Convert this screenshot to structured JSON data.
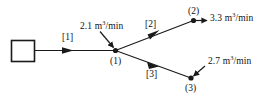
{
  "diagram": {
    "background_color": "#ffffff",
    "line_color": "#1a1a1a",
    "source": {
      "shape": "rectangle",
      "label": ""
    },
    "pipes": [
      {
        "id": "pipe-1",
        "label": "[1]",
        "from": "source",
        "to": "(1)"
      },
      {
        "id": "pipe-2",
        "label": "[2]",
        "from": "(1)",
        "to": "(2)"
      },
      {
        "id": "pipe-3",
        "label": "[3]",
        "from": "(1)",
        "to": "(3)"
      }
    ],
    "nodes": [
      {
        "id": "node-1",
        "label": "(1)"
      },
      {
        "id": "node-2",
        "label": "(2)"
      },
      {
        "id": "node-3",
        "label": "(3)"
      }
    ],
    "flows": [
      {
        "id": "flow-inflow-node1",
        "value": "2.1",
        "unit_prefix": "m",
        "unit_exp": "3",
        "unit_suffix": "/min",
        "at_node": "(1)",
        "direction": "in"
      },
      {
        "id": "flow-outflow-node2",
        "value": "3.3",
        "unit_prefix": "m",
        "unit_exp": "3",
        "unit_suffix": "/min",
        "at_node": "(2)",
        "direction": "out"
      },
      {
        "id": "flow-inflow-node3",
        "value": "2.7",
        "unit_prefix": "m",
        "unit_exp": "3",
        "unit_suffix": "/min",
        "at_node": "(3)",
        "direction": "in"
      }
    ]
  },
  "labels": {
    "pipe_1": "[1]",
    "pipe_2": "[2]",
    "pipe_3": "[3]",
    "node_1": "(1)",
    "node_2": "(2)",
    "node_3": "(3)",
    "flow_21_value": "2.1",
    "flow_21_unit_m": "m",
    "flow_21_unit_exp": "3",
    "flow_21_unit_rest": "/min",
    "flow_33_value": "3.3",
    "flow_33_unit_m": "m",
    "flow_33_unit_exp": "3",
    "flow_33_unit_rest": "/min",
    "flow_27_value": "2.7",
    "flow_27_unit_m": "m",
    "flow_27_unit_exp": "3",
    "flow_27_unit_rest": "/min"
  }
}
